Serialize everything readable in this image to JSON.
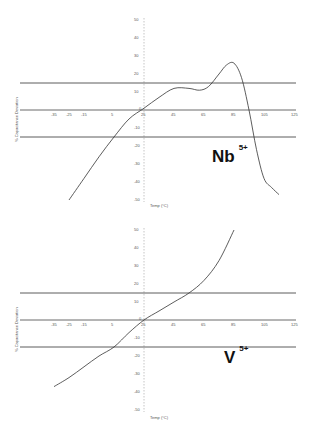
{
  "chart_data": [
    {
      "type": "line",
      "title": "Nb 5+",
      "label_main": "Nb",
      "label_sup": "5+",
      "xlabel": "Temp (°C)",
      "ylabel": "% Capacitance Deviation",
      "x_ticks": [
        -35,
        -25,
        -15,
        5,
        25,
        45,
        65,
        85,
        105,
        125
      ],
      "x_tick_labels": [
        "-35",
        "-25",
        "-15",
        "5",
        "25",
        "45",
        "65",
        "85",
        "105",
        "125"
      ],
      "y_ticks": [
        50,
        40,
        30,
        20,
        10,
        0,
        -10,
        -20,
        -30,
        -40,
        -50
      ],
      "y_tick_labels": [
        "50",
        "40",
        "30",
        "20",
        "10",
        "0",
        "-10",
        "-20",
        "-30",
        "-40",
        "-50"
      ],
      "xlim": [
        -35,
        125
      ],
      "ylim": [
        -50,
        50
      ],
      "reference_lines": [
        15,
        -15
      ],
      "series": [
        {
          "name": "Nb 5+",
          "x": [
            -25,
            -15,
            -5,
            5,
            15,
            25,
            35,
            45,
            55,
            62,
            68,
            75,
            80,
            85,
            90,
            95,
            100,
            105,
            110,
            115
          ],
          "y": [
            -50,
            -38,
            -26,
            -15,
            -5,
            1,
            7,
            12,
            12,
            11,
            13,
            20,
            25,
            26,
            18,
            0,
            -22,
            -38,
            -43,
            -47
          ]
        }
      ]
    },
    {
      "type": "line",
      "title": "V 5+",
      "label_main": "V",
      "label_sup": "5+",
      "xlabel": "Temp (°C)",
      "ylabel": "% Capacitance Deviation",
      "x_ticks": [
        -35,
        -25,
        -15,
        5,
        25,
        45,
        65,
        85,
        105,
        125
      ],
      "x_tick_labels": [
        "-35",
        "-25",
        "-15",
        "5",
        "25",
        "45",
        "65",
        "85",
        "105",
        "125"
      ],
      "y_ticks": [
        50,
        40,
        30,
        20,
        10,
        0,
        -10,
        -20,
        -30,
        -40,
        -50
      ],
      "y_tick_labels": [
        "50",
        "40",
        "30",
        "20",
        "10",
        "0",
        "-10",
        "-20",
        "-30",
        "-40",
        "-50"
      ],
      "xlim": [
        -35,
        125
      ],
      "ylim": [
        -50,
        50
      ],
      "reference_lines": [
        15,
        -15
      ],
      "series": [
        {
          "name": "V 5+",
          "x": [
            -35,
            -25,
            -15,
            -5,
            5,
            15,
            25,
            35,
            45,
            55,
            65,
            75,
            85
          ],
          "y": [
            -37,
            -32,
            -26,
            -20,
            -15,
            -7,
            0,
            5,
            10,
            15,
            22,
            33,
            50
          ]
        }
      ]
    }
  ]
}
